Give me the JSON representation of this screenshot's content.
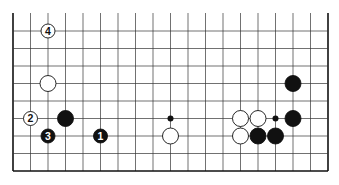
{
  "diagram": {
    "type": "go-board-fragment",
    "columns": 19,
    "rows_visible": 9,
    "bottom_edge_visible": true,
    "top_edge_visible": false,
    "grid": {
      "x0": 13,
      "y0": 31,
      "spacing": 17.5,
      "top_cut": 13
    },
    "hoshi": [
      [
        9,
        5
      ],
      [
        15,
        5
      ]
    ],
    "stones": [
      {
        "col": 2,
        "row": 0,
        "color": "white",
        "label": "4"
      },
      {
        "col": 2,
        "row": 3,
        "color": "white",
        "label": ""
      },
      {
        "col": 1,
        "row": 5,
        "color": "white",
        "label": "2"
      },
      {
        "col": 3,
        "row": 5,
        "color": "black",
        "label": ""
      },
      {
        "col": 2,
        "row": 6,
        "color": "black",
        "label": "3"
      },
      {
        "col": 5,
        "row": 6,
        "color": "black",
        "label": "1"
      },
      {
        "col": 9,
        "row": 6,
        "color": "white",
        "label": ""
      },
      {
        "col": 13,
        "row": 5,
        "color": "white",
        "label": ""
      },
      {
        "col": 14,
        "row": 5,
        "color": "white",
        "label": ""
      },
      {
        "col": 16,
        "row": 5,
        "color": "black",
        "label": ""
      },
      {
        "col": 16,
        "row": 3,
        "color": "black",
        "label": ""
      },
      {
        "col": 13,
        "row": 6,
        "color": "white",
        "label": ""
      },
      {
        "col": 14,
        "row": 6,
        "color": "black",
        "label": ""
      },
      {
        "col": 15,
        "row": 6,
        "color": "black",
        "label": ""
      }
    ],
    "colors": {
      "line": "#333333",
      "edge": "#111111",
      "black": "#111111",
      "white": "#ffffff"
    }
  }
}
